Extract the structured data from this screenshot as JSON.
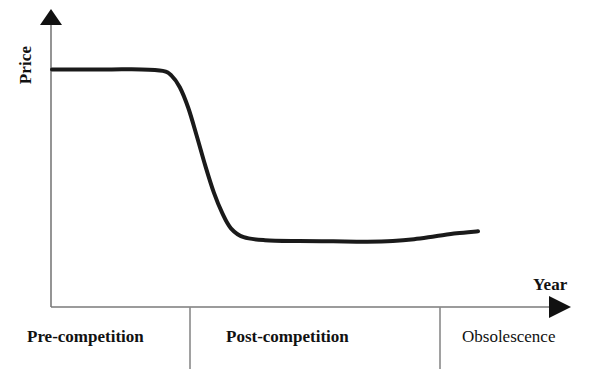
{
  "chart_data": {
    "type": "line",
    "title": "",
    "xlabel": "Year",
    "ylabel": "Price",
    "grid": false,
    "legend": "none",
    "xlim": [
      0,
      1
    ],
    "ylim": [
      0,
      1
    ],
    "axis_style": "arrow-headed open axes",
    "annotations": [
      "Pre-competition",
      "Post-competition",
      "Obsolescence"
    ],
    "phases": [
      {
        "label": "Pre-competition",
        "x_start": 0.0,
        "x_end": 0.268,
        "emphasis": "bold",
        "description": "Price holds flat at its high plateau."
      },
      {
        "label": "Post-competition",
        "x_start": 0.268,
        "x_end": 0.749,
        "emphasis": "bold",
        "description": "Price collapses steeply then settles on a low plateau."
      },
      {
        "label": "Obsolescence",
        "x_start": 0.749,
        "x_end": 1.0,
        "emphasis": "normal",
        "description": "Price ticks slightly upward at the end of life."
      }
    ],
    "series": [
      {
        "name": "Price over time",
        "x": [
          0.0,
          0.07,
          0.14,
          0.21,
          0.26,
          0.28,
          0.3,
          0.32,
          0.34,
          0.36,
          0.38,
          0.4,
          0.42,
          0.45,
          0.5,
          0.58,
          0.66,
          0.74,
          0.8,
          0.85,
          0.9,
          0.95,
          1.0
        ],
        "y": [
          0.8,
          0.8,
          0.8,
          0.8,
          0.795,
          0.78,
          0.74,
          0.67,
          0.575,
          0.475,
          0.385,
          0.315,
          0.265,
          0.235,
          0.225,
          0.222,
          0.221,
          0.22,
          0.222,
          0.228,
          0.238,
          0.248,
          0.255
        ],
        "color": "#1a1a1a",
        "linewidth": 4,
        "shape": "high plateau, sigmoid drop, low plateau, slight final rise"
      }
    ],
    "key_points": {
      "initial_plateau_price": 0.8,
      "drop_midpoint_x": 0.355,
      "low_plateau_price": 0.22,
      "final_price": 0.255
    }
  },
  "axes": {
    "y_axis_label": "Price",
    "x_axis_label": "Year"
  },
  "phase_labels": {
    "pre": "Pre-competition",
    "post": "Post-competition",
    "obsolescence": "Obsolescence"
  },
  "colors": {
    "curve": "#1a1a1a",
    "axis": "#7a7a7a",
    "arrow": "#111111",
    "divider": "#8a8a8a",
    "text": "#111111",
    "background": "#ffffff"
  }
}
